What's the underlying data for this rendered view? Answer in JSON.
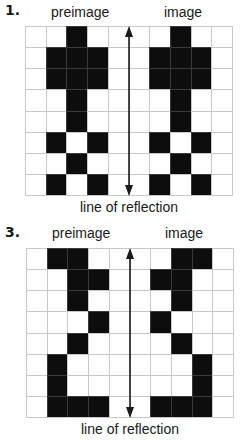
{
  "problems": [
    {
      "number": "1.",
      "preimage_label": "preimage",
      "image_label": "image",
      "axis_label": "line of reflection",
      "grid": {
        "columns": 10,
        "rows": 8,
        "filled_cells": [
          [
            0,
            2
          ],
          [
            0,
            7
          ],
          [
            1,
            1
          ],
          [
            1,
            2
          ],
          [
            1,
            3
          ],
          [
            1,
            6
          ],
          [
            1,
            7
          ],
          [
            1,
            8
          ],
          [
            2,
            1
          ],
          [
            2,
            2
          ],
          [
            2,
            3
          ],
          [
            2,
            6
          ],
          [
            2,
            7
          ],
          [
            2,
            8
          ],
          [
            3,
            2
          ],
          [
            3,
            7
          ],
          [
            4,
            2
          ],
          [
            4,
            7
          ],
          [
            5,
            1
          ],
          [
            5,
            3
          ],
          [
            5,
            6
          ],
          [
            5,
            8
          ],
          [
            6,
            2
          ],
          [
            6,
            7
          ],
          [
            7,
            1
          ],
          [
            7,
            3
          ],
          [
            7,
            6
          ],
          [
            7,
            8
          ]
        ]
      },
      "axis_icon": "double-headed-vertical-arrow"
    },
    {
      "number": "3.",
      "preimage_label": "preimage",
      "image_label": "image",
      "axis_label": "line of reflection",
      "grid": {
        "columns": 10,
        "rows": 8,
        "filled_cells": [
          [
            0,
            1
          ],
          [
            0,
            2
          ],
          [
            0,
            7
          ],
          [
            0,
            8
          ],
          [
            1,
            2
          ],
          [
            1,
            3
          ],
          [
            1,
            6
          ],
          [
            1,
            7
          ],
          [
            2,
            2
          ],
          [
            2,
            7
          ],
          [
            3,
            3
          ],
          [
            3,
            6
          ],
          [
            4,
            2
          ],
          [
            4,
            7
          ],
          [
            5,
            1
          ],
          [
            5,
            8
          ],
          [
            6,
            1
          ],
          [
            6,
            8
          ],
          [
            7,
            1
          ],
          [
            7,
            2
          ],
          [
            7,
            3
          ],
          [
            7,
            6
          ],
          [
            7,
            7
          ],
          [
            7,
            8
          ]
        ]
      },
      "axis_icon": "double-headed-vertical-arrow"
    }
  ],
  "colors": {
    "filled": "#0d0d0d",
    "grid_line": "#c8c8c8",
    "background": "#ffffff"
  }
}
